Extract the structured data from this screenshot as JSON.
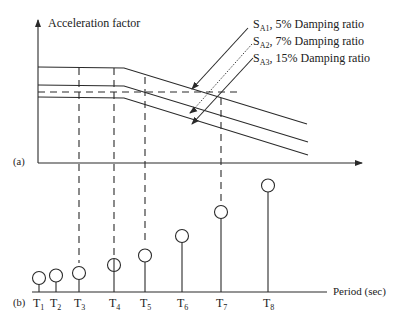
{
  "panel_a": {
    "label": "(a)",
    "y_axis_label": "Acceleration factor",
    "curves": [
      {
        "id": "SA1",
        "sub": "A1",
        "text": ", 5% Damping ratio",
        "plateau_y": 67,
        "end_y": 124
      },
      {
        "id": "SA2",
        "sub": "A2",
        "text": ", 7% Damping ratio",
        "plateau_y": 85,
        "end_y": 142
      },
      {
        "id": "SA3",
        "sub": "A3",
        "text": ", 15% Damping ratio",
        "plateau_y": 97,
        "end_y": 155
      }
    ],
    "curve_prefix": "S"
  },
  "panel_b": {
    "label": "(b)",
    "x_axis_label": "Period (sec)",
    "periods": [
      {
        "label": "T",
        "sub": "1",
        "x": 39,
        "cy": 278
      },
      {
        "label": "T",
        "sub": "2",
        "x": 56,
        "cy": 276
      },
      {
        "label": "T",
        "sub": "3",
        "x": 79,
        "cy": 273
      },
      {
        "label": "T",
        "sub": "4",
        "x": 114,
        "cy": 265
      },
      {
        "label": "T",
        "sub": "5",
        "x": 145,
        "cy": 256
      },
      {
        "label": "T",
        "sub": "6",
        "x": 182,
        "cy": 236
      },
      {
        "label": "T",
        "sub": "7",
        "x": 221,
        "cy": 212
      },
      {
        "label": "T",
        "sub": "8",
        "x": 268,
        "cy": 186
      }
    ]
  }
}
